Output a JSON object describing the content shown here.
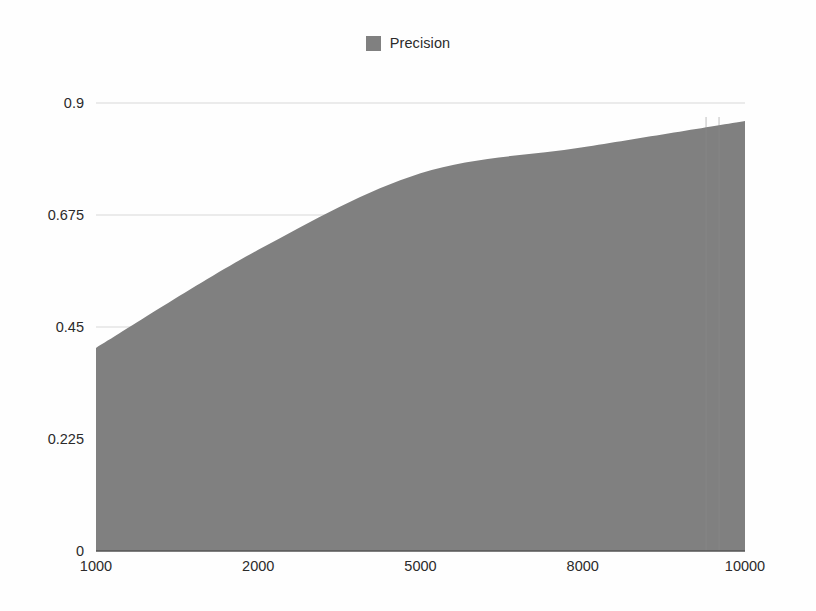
{
  "chart_data": {
    "type": "area",
    "title": "",
    "subtitle": "",
    "xlabel": "",
    "ylabel": "",
    "categories": [
      "1000",
      "2000",
      "5000",
      "8000",
      "10000"
    ],
    "x": [
      1000,
      2000,
      5000,
      8000,
      10000
    ],
    "series": [
      {
        "name": "Precision",
        "color": "#808080",
        "values": [
          0.408,
          0.605,
          0.759,
          0.811,
          0.864
        ]
      }
    ],
    "ylim": [
      0,
      0.9
    ],
    "yticks": [
      0,
      0.225,
      0.45,
      0.675,
      0.9
    ],
    "ytick_labels": [
      "0",
      "0.225",
      "0.45",
      "0.675",
      "0.9"
    ],
    "xtick_labels": [
      "1000",
      "2000",
      "5000",
      "8000",
      "10000"
    ],
    "grid": {
      "horizontal": true,
      "vertical": false,
      "color": "#d8d8d8"
    },
    "legend": {
      "position": "top-center",
      "entries": [
        {
          "label": "Precision",
          "color": "#808080"
        }
      ]
    },
    "axis": {
      "baseline_color": "#555555",
      "background": "#fefefe"
    },
    "annotations": []
  },
  "legend": {
    "precision_label": "Precision"
  },
  "axes": {
    "y_labels": [
      "0.9",
      "0.675",
      "0.45",
      "0.225",
      "0"
    ],
    "x_labels": [
      "1000",
      "2000",
      "5000",
      "8000",
      "10000"
    ]
  },
  "colors": {
    "series_fill": "#808080",
    "grid": "#d8d8d8",
    "baseline": "#555555",
    "text": "#2b2b2b",
    "background": "#fefefe"
  }
}
